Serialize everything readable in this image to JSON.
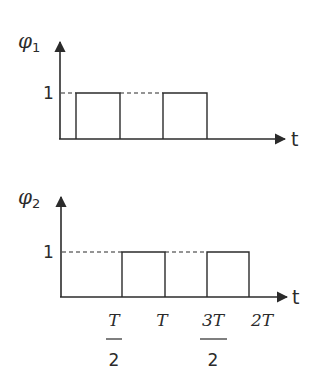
{
  "diagram": {
    "type": "timing-diagram",
    "colors": {
      "line": "#2b2b2b",
      "background": "#ffffff"
    },
    "plots": [
      {
        "id": "phi1",
        "y_label": "φ",
        "y_label_sub": "1",
        "x_label": "t",
        "level_label": "1",
        "pulses": [
          {
            "start": "0.25T",
            "end": "T/2"
          },
          {
            "start": "T+0.25T",
            "end": "3T/2"
          }
        ]
      },
      {
        "id": "phi2",
        "y_label": "φ",
        "y_label_sub": "2",
        "x_label": "t",
        "level_label": "1",
        "pulses": [
          {
            "start": "T/2",
            "end": "T"
          },
          {
            "start": "3T/2",
            "end": "2T"
          }
        ]
      }
    ],
    "x_ticks": [
      {
        "num": "T",
        "den": "2"
      },
      {
        "text": "T"
      },
      {
        "num": "3T",
        "den": "2"
      },
      {
        "text": "2T"
      }
    ]
  }
}
